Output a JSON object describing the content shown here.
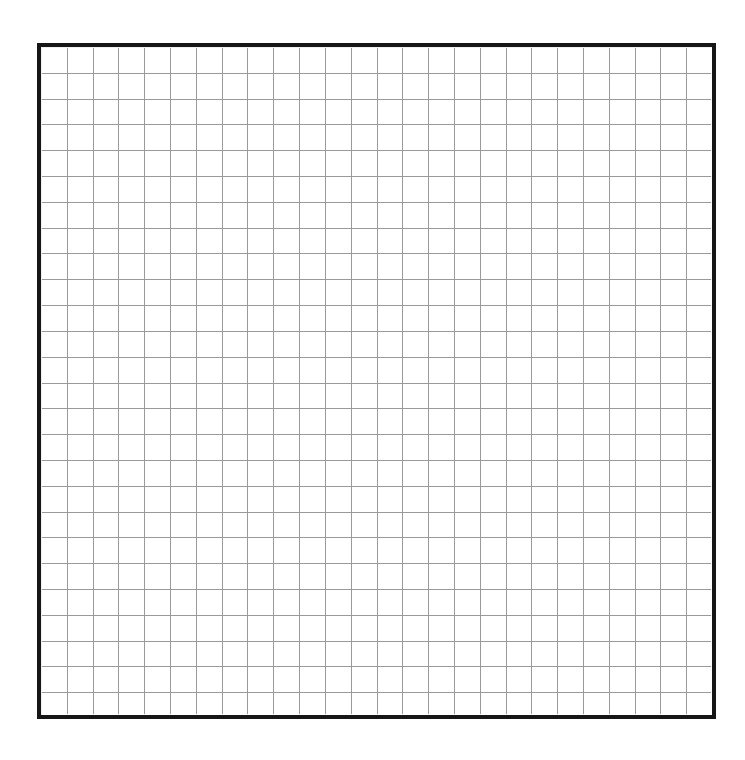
{
  "canvas": {
    "width": 745,
    "height": 760,
    "background_color": "#ffffff",
    "label": "Blank grid canvas"
  },
  "grid_panel": {
    "label": "Grid drawing area",
    "x": 37,
    "y": 43,
    "width": 679,
    "height": 676,
    "border_color": "#161616",
    "border_width": 4,
    "fill_color": "#ffffff"
  },
  "chart_data": {
    "type": "grid",
    "title": "",
    "subtitle": "",
    "xlabel": "",
    "ylabel": "",
    "columns": 26,
    "rows": 26,
    "cell_width": 25.81,
    "cell_height": 25.81,
    "grid": true,
    "grid_color": "#9a9a9a",
    "grid_line_width": 1,
    "legend": [],
    "annotations": [],
    "tick_labels_x": [],
    "tick_labels_y": [],
    "series": [],
    "values": []
  }
}
